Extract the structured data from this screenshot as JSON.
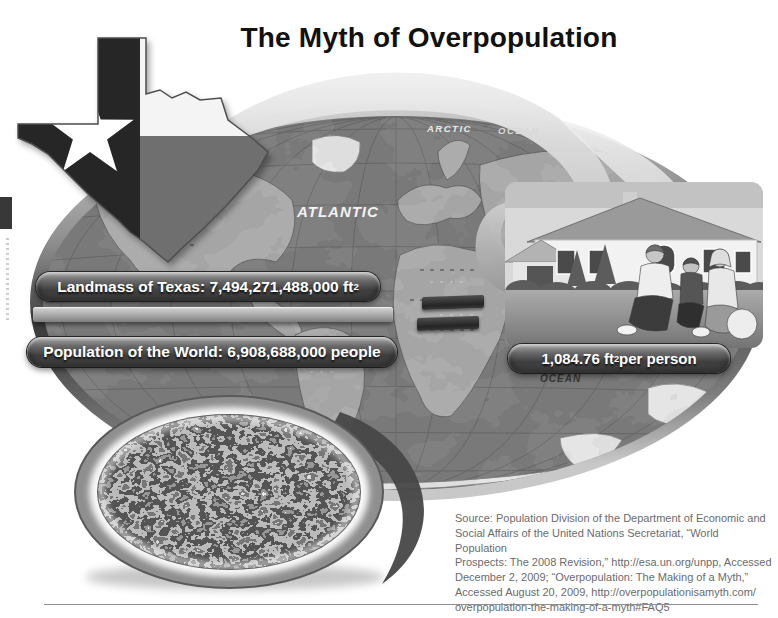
{
  "title": "The Myth of Overpopulation",
  "equation": {
    "landmass_label": "Landmass of Texas: 7,494,271,488,000 ft",
    "landmass_sup": "2",
    "population_label": "Population of the World: 6,908,688,000 people",
    "result_value": "1,084.76 ft",
    "result_sup": "2",
    "result_suffix": " per person"
  },
  "map_labels": {
    "arctic": "ARCTIC",
    "ocean_top": "OCEAN",
    "atlantic": "ATLANTIC",
    "ocean_right": "OCEAN"
  },
  "source_lines": [
    "Source: Population Division of the Department of Economic and",
    "Social Affairs of the United Nations Secretariat, “World Population",
    "Prospects: The 2008 Revision,” http://esa.un.org/unpp, Accessed",
    "December 2, 2009; “Overpopulation: The Making of a Myth,”",
    "Accessed August 20, 2009, http://overpopulationisamyth.com/",
    "overpopulation-the-making-of-a-myth#FAQ5"
  ],
  "colors": {
    "title-text": "#111111",
    "pill-dark": "#3f3f3f",
    "map-sea": "#6e6e6e",
    "map-land": "#a2a2a2",
    "text-source": "#6b6b6b"
  }
}
